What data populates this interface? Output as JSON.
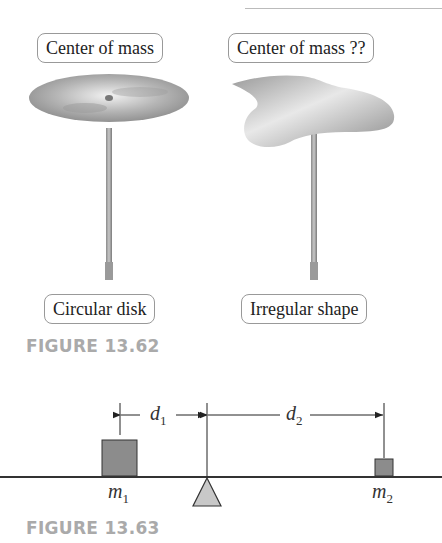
{
  "figure_62": {
    "caption": "FIGURE 13.62",
    "left": {
      "top_label": "Center of mass",
      "bottom_label": "Circular disk",
      "shape": "circular-disk-on-rod"
    },
    "right": {
      "top_label": "Center of mass ??",
      "bottom_label": "Irregular shape",
      "shape": "irregular-plate-on-rod"
    }
  },
  "figure_63": {
    "caption": "FIGURE 13.63",
    "mass1": {
      "symbol": "m",
      "subscript": "1"
    },
    "mass2": {
      "symbol": "m",
      "subscript": "2"
    },
    "dist1": {
      "symbol": "d",
      "subscript": "1"
    },
    "dist2": {
      "symbol": "d",
      "subscript": "2"
    }
  },
  "colors": {
    "mass_fill": "#8c8c8c",
    "fulcrum_fill": "#c8c8c8",
    "caption": "#aaaaaa",
    "line": "#333333"
  }
}
